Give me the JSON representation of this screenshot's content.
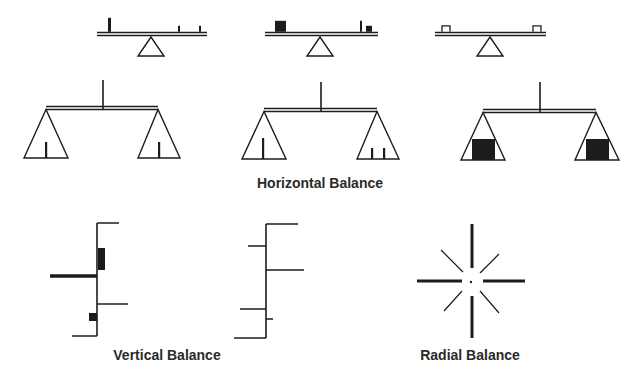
{
  "colors": {
    "ink": "#1c1c1c",
    "caption": "#2a2a2a",
    "background": "#ffffff"
  },
  "captions": {
    "horizontal": {
      "text": "Horizontal Balance",
      "x": 320,
      "y": 175
    },
    "vertical": {
      "text": "Vertical Balance",
      "x": 167,
      "y": 347
    },
    "radial": {
      "text": "Radial Balance",
      "x": 470,
      "y": 347
    }
  },
  "seesaws": [
    {
      "id": "seesaw-uneven-weights",
      "beam": {
        "x1": 97,
        "x2": 207,
        "y": 34
      },
      "fulcrum": {
        "cx": 151,
        "top": 37,
        "bottom": 56,
        "half": 13
      },
      "items": [
        {
          "kind": "bar",
          "x": 108,
          "w": 3,
          "h": 14
        },
        {
          "kind": "bar",
          "x": 178,
          "w": 2,
          "h": 6
        },
        {
          "kind": "bar",
          "x": 199,
          "w": 2,
          "h": 6
        }
      ]
    },
    {
      "id": "seesaw-block-vs-post",
      "beam": {
        "x1": 265,
        "x2": 378,
        "y": 34
      },
      "fulcrum": {
        "cx": 320,
        "top": 37,
        "bottom": 56,
        "half": 13
      },
      "items": [
        {
          "kind": "block",
          "x": 275,
          "w": 11,
          "h": 11
        },
        {
          "kind": "bar",
          "x": 360,
          "w": 2,
          "h": 11
        },
        {
          "kind": "block",
          "x": 366,
          "w": 6,
          "h": 6
        }
      ]
    },
    {
      "id": "seesaw-symmetric-boxes",
      "beam": {
        "x1": 435,
        "x2": 546,
        "y": 34
      },
      "fulcrum": {
        "cx": 490,
        "top": 37,
        "bottom": 56,
        "half": 13
      },
      "items": [
        {
          "kind": "box",
          "x": 442,
          "w": 8,
          "h": 6
        },
        {
          "kind": "box",
          "x": 533,
          "w": 8,
          "h": 6
        }
      ]
    }
  ],
  "scales": [
    {
      "id": "scale-single-weights",
      "post": {
        "x": 103,
        "top": 80,
        "bottom": 109
      },
      "beam": {
        "x1": 46,
        "x2": 158,
        "y": 108
      },
      "pans": [
        {
          "apex": 46,
          "left": 24,
          "right": 68,
          "bottom": 158,
          "contents": [
            {
              "kind": "bar",
              "x": 46,
              "h": 16
            }
          ]
        },
        {
          "apex": 158,
          "left": 138,
          "right": 180,
          "bottom": 158,
          "contents": [
            {
              "kind": "bar",
              "x": 159,
              "h": 16
            }
          ]
        }
      ]
    },
    {
      "id": "scale-one-vs-two",
      "post": {
        "x": 321,
        "top": 82,
        "bottom": 111
      },
      "beam": {
        "x1": 264,
        "x2": 377,
        "y": 110
      },
      "pans": [
        {
          "apex": 264,
          "left": 242,
          "right": 286,
          "bottom": 159,
          "contents": [
            {
              "kind": "bar",
              "x": 263,
              "h": 21
            }
          ]
        },
        {
          "apex": 377,
          "left": 357,
          "right": 399,
          "bottom": 159,
          "contents": [
            {
              "kind": "bar",
              "x": 372,
              "h": 11
            },
            {
              "kind": "bar",
              "x": 384,
              "h": 11
            }
          ]
        }
      ]
    },
    {
      "id": "scale-two-blocks",
      "post": {
        "x": 540,
        "top": 82,
        "bottom": 112
      },
      "beam": {
        "x1": 483,
        "x2": 596,
        "y": 111
      },
      "pans": [
        {
          "apex": 483,
          "left": 461,
          "right": 505,
          "bottom": 160,
          "contents": [
            {
              "kind": "block",
              "x": 472,
              "w": 23,
              "h": 21
            }
          ]
        },
        {
          "apex": 596,
          "left": 575,
          "right": 619,
          "bottom": 160,
          "contents": [
            {
              "kind": "block",
              "x": 586,
              "w": 23,
              "h": 21
            }
          ]
        }
      ]
    }
  ],
  "verticals": [
    {
      "id": "vertical-weighted",
      "axis": {
        "x": 97,
        "top": 223,
        "bottom": 336
      },
      "lines": [
        {
          "x1": 97,
          "x2": 119,
          "y": 223,
          "w": 1.5
        },
        {
          "x1": 50,
          "x2": 97,
          "y": 276,
          "w": 3.5
        },
        {
          "x1": 97,
          "x2": 128,
          "y": 304,
          "w": 1.5
        },
        {
          "x1": 72,
          "x2": 97,
          "y": 336,
          "w": 1.5
        }
      ],
      "blocks": [
        {
          "x": 98,
          "y": 248,
          "w": 7,
          "h": 22
        },
        {
          "x": 89,
          "y": 313,
          "w": 8,
          "h": 8
        }
      ]
    },
    {
      "id": "vertical-lines-only",
      "axis": {
        "x": 266,
        "top": 224,
        "bottom": 338
      },
      "lines": [
        {
          "x1": 266,
          "x2": 298,
          "y": 224,
          "w": 1.5
        },
        {
          "x1": 248,
          "x2": 266,
          "y": 246,
          "w": 1.5
        },
        {
          "x1": 266,
          "x2": 304,
          "y": 270,
          "w": 1.5
        },
        {
          "x1": 240,
          "x2": 266,
          "y": 309,
          "w": 1.5
        },
        {
          "x1": 266,
          "x2": 273,
          "y": 319,
          "w": 1.5
        },
        {
          "x1": 234,
          "x2": 266,
          "y": 338,
          "w": 1.5
        }
      ],
      "blocks": []
    }
  ],
  "radial": {
    "id": "radial-star",
    "center": {
      "x": 471,
      "y": 282
    },
    "spokes": [
      {
        "x1": 472,
        "y1": 224,
        "x2": 472,
        "y2": 268,
        "w": 3
      },
      {
        "x1": 472,
        "y1": 296,
        "x2": 472,
        "y2": 338,
        "w": 3
      },
      {
        "x1": 417,
        "y1": 281,
        "x2": 462,
        "y2": 281,
        "w": 3
      },
      {
        "x1": 483,
        "y1": 281,
        "x2": 525,
        "y2": 281,
        "w": 3
      },
      {
        "x1": 441,
        "y1": 250,
        "x2": 463,
        "y2": 272,
        "w": 1.2
      },
      {
        "x1": 499,
        "y1": 254,
        "x2": 480,
        "y2": 273,
        "w": 1.2
      },
      {
        "x1": 462,
        "y1": 291,
        "x2": 444,
        "y2": 311,
        "w": 1.2
      },
      {
        "x1": 480,
        "y1": 291,
        "x2": 499,
        "y2": 313,
        "w": 1.2
      }
    ],
    "dot_r": 1.2
  }
}
